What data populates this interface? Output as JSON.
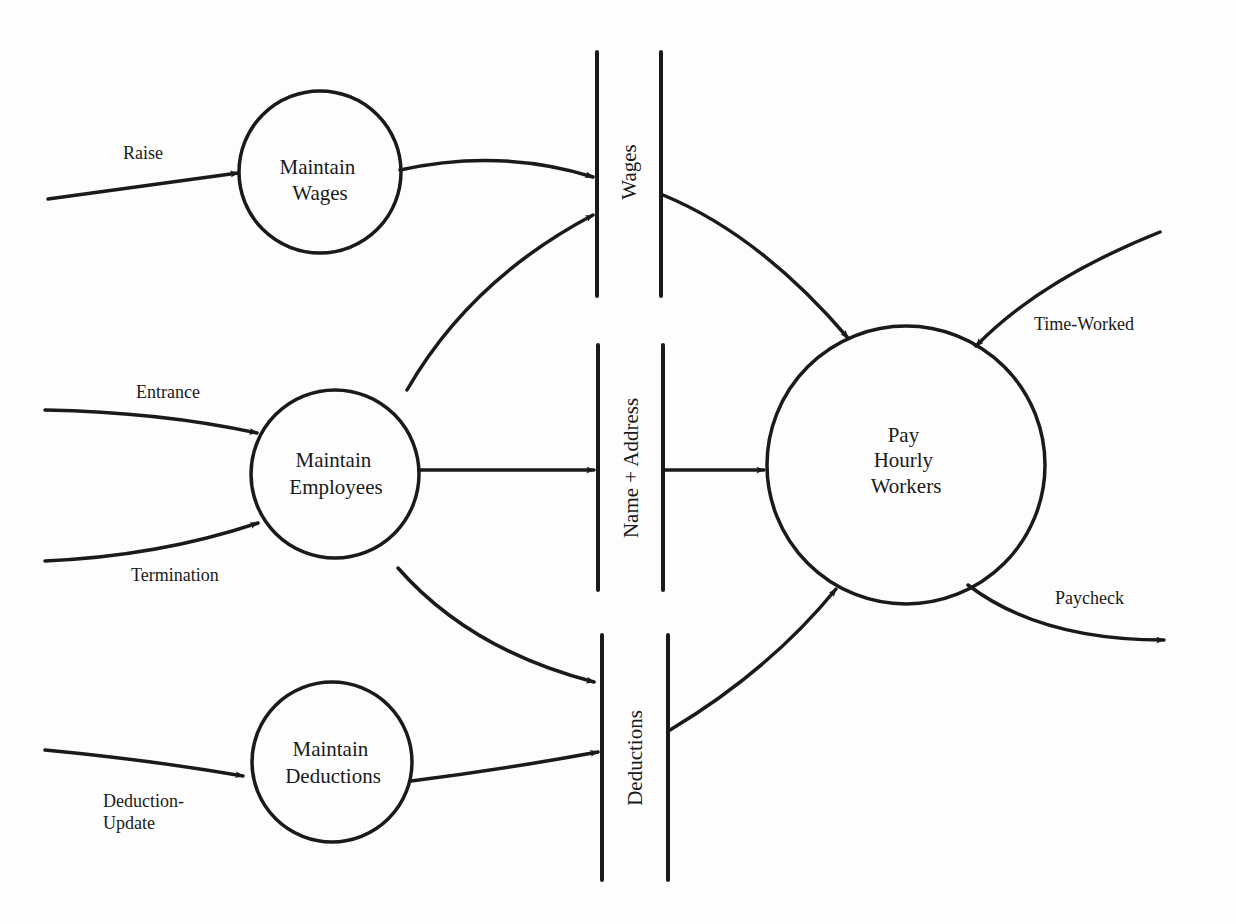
{
  "diagram": {
    "type": "data-flow-diagram",
    "processes": [
      {
        "id": "maintain_wages",
        "line1": "Maintain",
        "line2": "Wages"
      },
      {
        "id": "maintain_employees",
        "line1": "Maintain",
        "line2": "Employees"
      },
      {
        "id": "maintain_deductions",
        "line1": "Maintain",
        "line2": "Deductions"
      },
      {
        "id": "pay_hourly_workers",
        "line1": "Pay",
        "line2": "Hourly",
        "line3": "Workers"
      }
    ],
    "data_stores": [
      {
        "id": "wages",
        "label": "Wages"
      },
      {
        "id": "name_address",
        "label": "Name + Address"
      },
      {
        "id": "deductions",
        "label": "Deductions"
      }
    ],
    "flows": [
      {
        "label": "Raise",
        "from": "external",
        "to": "maintain_wages"
      },
      {
        "label": "Entrance",
        "from": "external",
        "to": "maintain_employees"
      },
      {
        "label": "Termination",
        "from": "external",
        "to": "maintain_employees"
      },
      {
        "label_line1": "Deduction-",
        "label_line2": "Update",
        "from": "external",
        "to": "maintain_deductions"
      },
      {
        "label": "Time-Worked",
        "from": "external",
        "to": "pay_hourly_workers"
      },
      {
        "label": "Paycheck",
        "from": "pay_hourly_workers",
        "to": "external"
      },
      {
        "label": "",
        "from": "maintain_wages",
        "to": "wages"
      },
      {
        "label": "",
        "from": "maintain_employees",
        "to": "wages"
      },
      {
        "label": "",
        "from": "maintain_employees",
        "to": "name_address"
      },
      {
        "label": "",
        "from": "maintain_employees",
        "to": "deductions"
      },
      {
        "label": "",
        "from": "maintain_deductions",
        "to": "deductions"
      },
      {
        "label": "",
        "from": "wages",
        "to": "pay_hourly_workers"
      },
      {
        "label": "",
        "from": "name_address",
        "to": "pay_hourly_workers"
      },
      {
        "label": "",
        "from": "deductions",
        "to": "pay_hourly_workers"
      }
    ]
  }
}
